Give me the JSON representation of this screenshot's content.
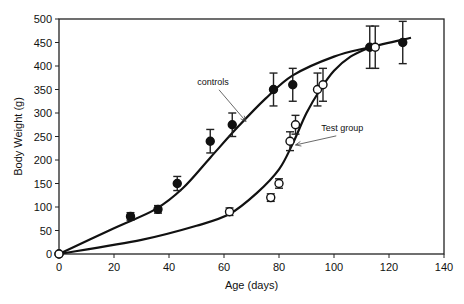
{
  "chart_data": {
    "type": "scatter",
    "title": "",
    "xlabel": "Age (days)",
    "ylabel": "Body Weight (g)",
    "xlim": [
      0,
      140
    ],
    "ylim": [
      0,
      500
    ],
    "xticks": [
      0,
      20,
      40,
      60,
      80,
      100,
      120,
      140
    ],
    "yticks": [
      0,
      50,
      100,
      150,
      200,
      250,
      300,
      350,
      400,
      450,
      500
    ],
    "grid": false,
    "legend": "none",
    "series": [
      {
        "name": "controls",
        "marker": "filled-circle",
        "x": [
          0,
          26,
          36,
          43,
          55,
          63,
          78,
          85,
          113,
          125
        ],
        "y": [
          0,
          80,
          95,
          150,
          240,
          275,
          350,
          360,
          440,
          450
        ],
        "err": [
          0,
          8,
          8,
          15,
          25,
          25,
          35,
          35,
          45,
          45
        ],
        "fit_line": [
          [
            0,
            0
          ],
          [
            20,
            55
          ],
          [
            35,
            95
          ],
          [
            45,
            140
          ],
          [
            55,
            205
          ],
          [
            65,
            270
          ],
          [
            75,
            330
          ],
          [
            85,
            380
          ],
          [
            100,
            420
          ],
          [
            113,
            440
          ],
          [
            128,
            460
          ]
        ]
      },
      {
        "name": "Test group",
        "marker": "open-circle",
        "x": [
          0,
          62,
          77,
          80,
          84,
          86,
          94,
          96,
          115
        ],
        "y": [
          0,
          90,
          120,
          150,
          240,
          275,
          350,
          360,
          440
        ],
        "err": [
          0,
          8,
          8,
          10,
          20,
          20,
          35,
          35,
          45
        ],
        "fit_line": [
          [
            0,
            0
          ],
          [
            30,
            30
          ],
          [
            50,
            60
          ],
          [
            62,
            85
          ],
          [
            72,
            130
          ],
          [
            80,
            180
          ],
          [
            85,
            235
          ],
          [
            90,
            300
          ],
          [
            95,
            350
          ],
          [
            100,
            390
          ],
          [
            106,
            420
          ],
          [
            113,
            440
          ]
        ]
      }
    ],
    "annotations": [
      {
        "text": "controls",
        "x": 56,
        "y": 360,
        "arrow_to": [
          68,
          282
        ]
      },
      {
        "text": "Test group",
        "x": 103,
        "y": 262,
        "arrow_to": [
          86,
          232
        ]
      }
    ]
  }
}
